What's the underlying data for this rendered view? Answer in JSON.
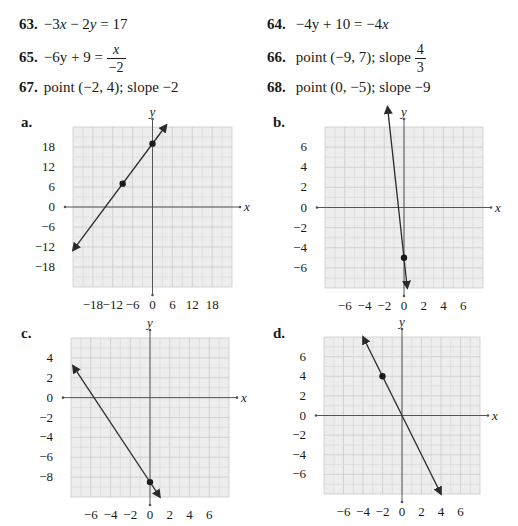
{
  "problems": [
    {
      "number": "63.",
      "parts": [
        "−3",
        "x",
        " − 2",
        "y",
        " = 17"
      ]
    },
    {
      "number": "64.",
      "parts": [
        "−4y + 10 = −4",
        "x",
        ""
      ]
    },
    {
      "number": "65.",
      "lhs": "−6y + 9 = ",
      "frac_num": "x",
      "frac_den": "−2"
    },
    {
      "number": "66.",
      "text": "point (−9, 7); slope ",
      "frac_num": "4",
      "frac_den": "3"
    },
    {
      "number": "67.",
      "text": "point (−2, 4); slope −2"
    },
    {
      "number": "68.",
      "text": "point (0, −5); slope −9"
    }
  ],
  "graphs": [
    {
      "label": "a.",
      "x_axis_label": "x",
      "y_axis_label": "y"
    },
    {
      "label": "b.",
      "x_axis_label": "x",
      "y_axis_label": "y"
    },
    {
      "label": "c.",
      "x_axis_label": "x",
      "y_axis_label": "y"
    },
    {
      "label": "d.",
      "x_axis_label": "x",
      "y_axis_label": "y"
    }
  ],
  "colors": {
    "grid_bg": "#ededed",
    "grid_minor": "#d9d9d9",
    "grid_major": "#c6c6c6",
    "axis": "#555555",
    "line": "#2b2b2b"
  },
  "chart_data": [
    {
      "type": "line",
      "title": "a.",
      "xlabel": "x",
      "ylabel": "y",
      "xlim": [
        -24,
        24
      ],
      "ylim": [
        -24,
        24
      ],
      "x_ticks": [
        -18,
        -12,
        -6,
        0,
        6,
        12,
        18
      ],
      "y_ticks": [
        18,
        12,
        6,
        0,
        -6,
        -12,
        -18
      ],
      "grid": true,
      "points": [
        {
          "x": -9,
          "y": 7
        },
        {
          "x": 0,
          "y": 19
        }
      ],
      "line": {
        "from": [
          -24,
          -13
        ],
        "to": [
          4.2,
          24.6
        ],
        "slope": 1.3333,
        "intercept": 19
      }
    },
    {
      "type": "line",
      "title": "b.",
      "xlabel": "x",
      "ylabel": "y",
      "xlim": [
        -8,
        8
      ],
      "ylim": [
        -8,
        8
      ],
      "x_ticks": [
        -6,
        -4,
        -2,
        0,
        2,
        4,
        6
      ],
      "y_ticks": [
        6,
        4,
        2,
        0,
        -2,
        -4,
        -6
      ],
      "grid": true,
      "points": [
        {
          "x": 0,
          "y": -5
        }
      ],
      "line": {
        "from": [
          -1.67,
          10
        ],
        "to": [
          0.33,
          -8
        ],
        "slope": -9,
        "intercept": -5
      }
    },
    {
      "type": "line",
      "title": "c.",
      "xlabel": "x",
      "ylabel": "y",
      "xlim": [
        -8,
        8
      ],
      "ylim": [
        -10,
        6
      ],
      "x_ticks": [
        -6,
        -4,
        -2,
        0,
        2,
        4,
        6
      ],
      "y_ticks": [
        4,
        2,
        0,
        -2,
        -4,
        -6,
        -8
      ],
      "grid": true,
      "points": [
        {
          "x": 0,
          "y": -8.5
        }
      ],
      "line": {
        "from": [
          -7.8,
          3.2
        ],
        "to": [
          1,
          -10
        ],
        "slope": -1.5,
        "intercept": -8.5
      }
    },
    {
      "type": "line",
      "title": "d.",
      "xlabel": "x",
      "ylabel": "y",
      "xlim": [
        -8,
        8
      ],
      "ylim": [
        -8,
        8
      ],
      "x_ticks": [
        -6,
        -4,
        -2,
        0,
        2,
        4,
        6
      ],
      "y_ticks": [
        6,
        4,
        2,
        0,
        -2,
        -4,
        -6
      ],
      "grid": true,
      "points": [
        {
          "x": -2,
          "y": 4
        }
      ],
      "line": {
        "from": [
          -4,
          8
        ],
        "to": [
          4,
          -8
        ],
        "slope": -2,
        "intercept": 0
      }
    }
  ]
}
